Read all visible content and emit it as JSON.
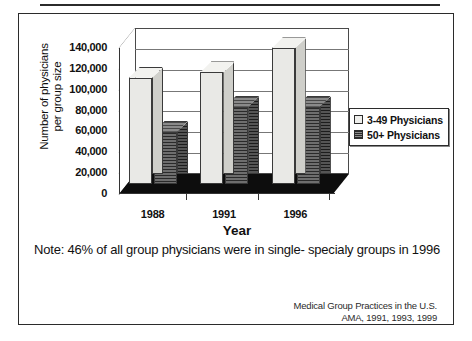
{
  "figure": {
    "note": {
      "line1": "Note: 46% of all group physicians were in single-",
      "line2": "specialy groups in 1996"
    },
    "source": {
      "line1": "Medical Group Practices in the U.S.",
      "line2": "AMA, 1991, 1993, 1999"
    }
  },
  "chart_data": {
    "type": "bar",
    "title": "",
    "xlabel": "Year",
    "ylabel": "Number of physicians per group size",
    "ylabel_lines": [
      "Number of physicians",
      "per group size"
    ],
    "categories": [
      "1988",
      "1991",
      "1996"
    ],
    "series": [
      {
        "name": "3-49 Physicians",
        "values": [
          102000,
          107000,
          130000
        ],
        "color": "#e9e9e6"
      },
      {
        "name": "50+ Physicians",
        "values": [
          50000,
          74000,
          74000
        ],
        "color": "#4e4e4e"
      }
    ],
    "ylim": [
      0,
      140000
    ],
    "ytick_values": [
      0,
      20000,
      40000,
      60000,
      80000,
      100000,
      120000,
      140000
    ],
    "ytick_labels": [
      "0",
      "20,000",
      "40,000",
      "60,000",
      "80,000",
      "100,000",
      "120,000",
      "140,000"
    ],
    "grid": true,
    "legend_position": "right",
    "three_d": true
  }
}
